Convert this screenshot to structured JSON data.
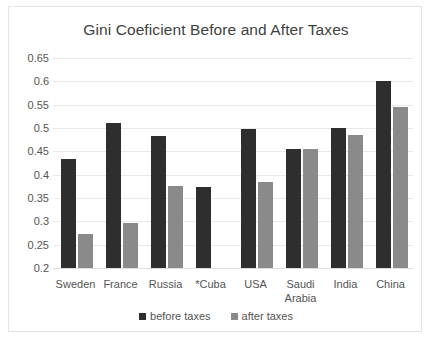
{
  "chart_data": {
    "type": "bar",
    "title": "Gini Coeficient Before and After Taxes",
    "xlabel": "",
    "ylabel": "",
    "ylim": [
      0.2,
      0.65
    ],
    "ytick_step": 0.05,
    "yticks": [
      "0.65",
      "0.6",
      "0.55",
      "0.5",
      "0.45",
      "0.4",
      "0.35",
      "0.3",
      "0.25",
      "0.2"
    ],
    "ytick_values": [
      0.65,
      0.6,
      0.55,
      0.5,
      0.45,
      0.4,
      0.35,
      0.3,
      0.25,
      0.2
    ],
    "grid": "horizontal",
    "legend_position": "bottom",
    "categories": [
      "Sweden",
      "France",
      "Russia",
      "*Cuba",
      "USA",
      "Saudi Arabia",
      "India",
      "China"
    ],
    "series": [
      {
        "name": "before taxes",
        "color": "#2e2e2e",
        "values": [
          0.433,
          0.511,
          0.483,
          0.373,
          0.498,
          0.454,
          0.5,
          0.6
        ]
      },
      {
        "name": "after taxes",
        "color": "#8a8a8a",
        "values": [
          0.273,
          0.296,
          0.375,
          null,
          0.385,
          0.454,
          0.485,
          0.546
        ]
      }
    ]
  },
  "legend": {
    "items": [
      {
        "label": "before taxes",
        "color": "#2e2e2e"
      },
      {
        "label": "after taxes",
        "color": "#8a8a8a"
      }
    ]
  }
}
